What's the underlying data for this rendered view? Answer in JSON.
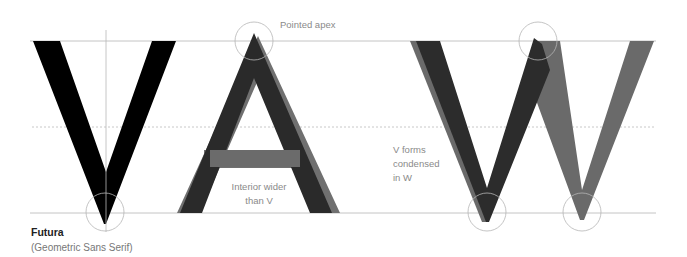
{
  "diagram": {
    "typeface": {
      "name": "Futura",
      "classification": "(Geometric Sans Serif)"
    },
    "letters": [
      "V",
      "A",
      "W"
    ],
    "annotations": {
      "apex": "Pointed apex",
      "interior_line1": "Interior wider",
      "interior_line2": "than V",
      "w_line1": "V forms",
      "w_line2": "condensed",
      "w_line3": "in W"
    },
    "colors": {
      "v_fill": "#000000",
      "a_dark": "#2a2a2a",
      "a_shadow": "#6e6e6e",
      "w_dark": "#2c2c2c",
      "w_gray": "#6a6a6a",
      "guide_line": "#bdbdbd",
      "circle_stroke": "#b0b0b0"
    },
    "guides": {
      "cap_line_y": 41,
      "mid_line_y": 127,
      "baseline_y": 213
    }
  }
}
